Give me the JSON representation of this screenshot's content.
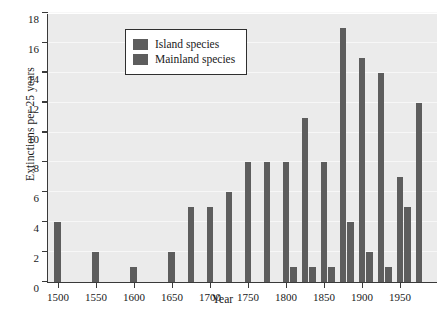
{
  "chart_data": {
    "type": "bar",
    "title": "",
    "xlabel": "Year",
    "ylabel": "Extinctions per 25 years",
    "xlim": [
      1487,
      2000
    ],
    "ylim": [
      0,
      18
    ],
    "ytick_values": [
      0,
      2,
      4,
      6,
      8,
      10,
      12,
      14,
      16,
      18
    ],
    "ytick_labels": [
      "0",
      "2",
      "4",
      "6",
      "8",
      "10",
      "12",
      "14",
      "16",
      "18"
    ],
    "xtick_values": [
      1500,
      1550,
      1600,
      1650,
      1700,
      1750,
      1800,
      1850,
      1900,
      1950
    ],
    "xtick_labels": [
      "1500",
      "1550",
      "1600",
      "1650",
      "1700",
      "1750",
      "1800",
      "1850",
      "1900",
      "1950"
    ],
    "grid": true,
    "bar_width_years": 9,
    "legend_position": "upper-left",
    "series": [
      {
        "name": "Island species",
        "color": "#5d5d5d",
        "points": [
          {
            "x": 1500,
            "y": 4
          },
          {
            "x": 1550,
            "y": 2
          },
          {
            "x": 1600,
            "y": 1
          },
          {
            "x": 1650,
            "y": 2
          },
          {
            "x": 1675,
            "y": 5
          },
          {
            "x": 1700,
            "y": 5
          },
          {
            "x": 1725,
            "y": 6
          },
          {
            "x": 1750,
            "y": 8
          },
          {
            "x": 1775,
            "y": 8
          },
          {
            "x": 1800,
            "y": 8
          },
          {
            "x": 1825,
            "y": 11
          },
          {
            "x": 1850,
            "y": 8
          },
          {
            "x": 1875,
            "y": 17
          },
          {
            "x": 1900,
            "y": 15
          },
          {
            "x": 1925,
            "y": 14
          },
          {
            "x": 1950,
            "y": 7
          },
          {
            "x": 1975,
            "y": 12
          }
        ]
      },
      {
        "name": "Mainland species",
        "color": "#5d5d5d",
        "points": [
          {
            "x": 1810,
            "y": 1
          },
          {
            "x": 1835,
            "y": 1
          },
          {
            "x": 1860,
            "y": 1
          },
          {
            "x": 1885,
            "y": 4
          },
          {
            "x": 1910,
            "y": 2
          },
          {
            "x": 1935,
            "y": 1
          },
          {
            "x": 1960,
            "y": 5
          }
        ]
      }
    ],
    "legend_entries": [
      {
        "label": "Island species",
        "color": "#5d5d5d"
      },
      {
        "label": "Mainland species",
        "color": "#5d5d5d"
      }
    ]
  }
}
